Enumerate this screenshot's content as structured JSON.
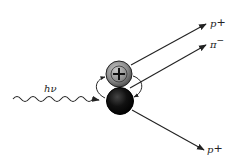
{
  "diagram": {
    "type": "particle-interaction",
    "photon": {
      "label": "hν"
    },
    "nucleons": [
      {
        "name": "proton",
        "symbol": "+",
        "fill": "#8a8a8a"
      },
      {
        "name": "neutron",
        "symbol": "",
        "fill": "#111111"
      }
    ],
    "outgoing": [
      {
        "label_main": "p",
        "label_sup": "+",
        "id": "proton-top"
      },
      {
        "label_main": "π",
        "label_sup": "−",
        "id": "pion-minus"
      },
      {
        "label_main": "p",
        "label_sup": "+",
        "id": "proton-bottom"
      }
    ]
  }
}
